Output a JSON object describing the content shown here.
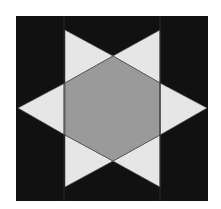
{
  "figure": {
    "colors": {
      "background": "#ffffff",
      "square": "#111111",
      "triangle": "#e6e6e6",
      "hexagon": "#9a9a9a",
      "edge": "#555555"
    },
    "square": {
      "x": 16,
      "y": 16,
      "w": 192,
      "h": 185
    },
    "hexagon": "113,56 160,83 160,135 113,161 65,135 65,83",
    "triangles": [
      {
        "name": "top-left-point",
        "points": "65,30 113,56 65,83"
      },
      {
        "name": "top-right-point",
        "points": "160,30 160,83 113,56"
      },
      {
        "name": "right-point",
        "points": "207,108 160,135 160,83"
      },
      {
        "name": "bottom-right-point",
        "points": "160,187 113,161 160,135"
      },
      {
        "name": "bottom-left-point",
        "points": "65,187 65,135 113,161"
      },
      {
        "name": "left-point",
        "points": "18,108 65,83 65,135"
      }
    ],
    "column_lines": [
      64,
      160
    ]
  }
}
